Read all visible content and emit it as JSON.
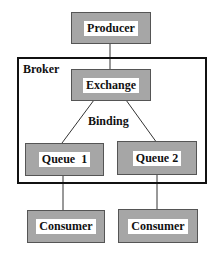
{
  "diagram": {
    "title": "",
    "colors": {
      "box_fill": "#a6a6a6",
      "box_border": "#555555",
      "label_bg": "#ffffff",
      "line": "#333333"
    },
    "nodes": {
      "producer": {
        "label": "Producer"
      },
      "exchange": {
        "label": "Exchange"
      },
      "queue1": {
        "label": "Queue  1"
      },
      "queue2": {
        "label": "Queue 2"
      },
      "consumer1": {
        "label": "Consumer"
      },
      "consumer2": {
        "label": "Consumer"
      }
    },
    "containers": {
      "broker": {
        "label": "Broker"
      }
    },
    "edge_labels": {
      "binding": "Binding"
    },
    "edges": [
      {
        "from": "producer",
        "to": "exchange"
      },
      {
        "from": "exchange",
        "to": "queue1",
        "label": "Binding"
      },
      {
        "from": "exchange",
        "to": "queue2",
        "label": "Binding"
      },
      {
        "from": "queue1",
        "to": "consumer1"
      },
      {
        "from": "queue2",
        "to": "consumer2"
      }
    ]
  }
}
